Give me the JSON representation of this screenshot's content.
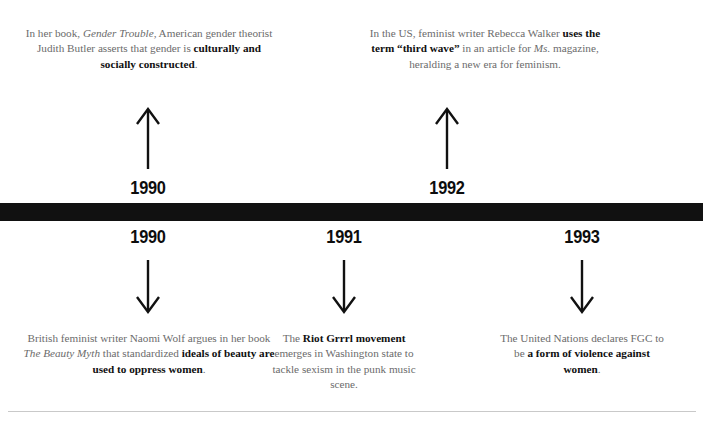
{
  "timeline": {
    "bar_color": "#111111",
    "text_color": "#6b6b6b",
    "emphasis_color": "#101010",
    "rule_color": "#c9c9c9"
  },
  "above": {
    "events": [
      {
        "year": "1990",
        "arrow": "arrow-up-icon",
        "text_plain": "In her book, Gender Trouble, American gender theorist Judith Butler asserts that gender is culturally and socially constructed.",
        "text_html": "In her book, <i>Gender Trouble</i>, American gender theorist Judith Butler asserts that gender is <b>culturally and socially constructed</b>."
      },
      {
        "year": "1992",
        "arrow": "arrow-up-icon",
        "text_plain": "In the US, feminist writer Rebecca Walker uses the term “third wave” in an article for Ms. magazine, heralding a new era for feminism.",
        "text_html": "In the US, feminist writer Rebecca Walker <b>uses the term “third wave”</b> in an article for <i>Ms.</i> magazine, heralding a new era for feminism."
      }
    ]
  },
  "below": {
    "events": [
      {
        "year": "1990",
        "arrow": "arrow-down-icon",
        "text_plain": "British feminist writer Naomi Wolf argues in her book The Beauty Myth that standardized ideals of beauty are used to oppress women.",
        "text_html": "British feminist writer Naomi Wolf argues in her book <i>The Beauty Myth</i> that standardized <b>ideals of beauty are used to oppress women</b>."
      },
      {
        "year": "1991",
        "arrow": "arrow-down-icon",
        "text_plain": "The Riot Grrrl movement emerges in Washington state to tackle sexism in the punk music scene.",
        "text_html": "The <b>Riot Grrrl movement</b> emerges in Washington state to tackle sexism in the punk music scene."
      },
      {
        "year": "1993",
        "arrow": "arrow-down-icon",
        "text_plain": "The United Nations declares FGC to be a form of violence against women.",
        "text_html": "The United Nations declares FGC to be <b>a form of violence against women</b>."
      }
    ]
  }
}
